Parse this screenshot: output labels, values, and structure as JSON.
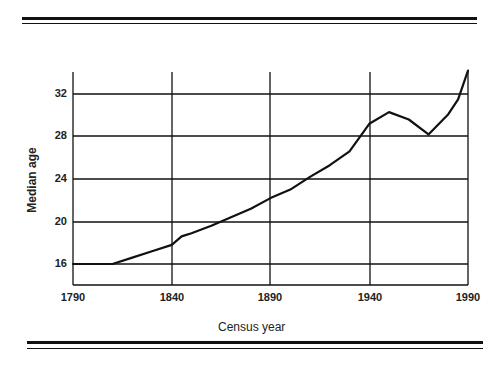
{
  "chart_data": {
    "type": "line",
    "title": "",
    "xlabel": "Census year",
    "ylabel": "Median age",
    "x_ticks": [
      "1790",
      "1840",
      "1890",
      "1940",
      "1990"
    ],
    "y_ticks": [
      "16",
      "20",
      "24",
      "28",
      "32"
    ],
    "xlim": [
      1790,
      1990
    ],
    "ylim": [
      14,
      34.5
    ],
    "grid": true,
    "legend": null,
    "series": [
      {
        "name": "Median age",
        "x": [
          1790,
          1800,
          1810,
          1820,
          1830,
          1840,
          1845,
          1850,
          1860,
          1870,
          1880,
          1890,
          1900,
          1910,
          1920,
          1930,
          1940,
          1950,
          1960,
          1970,
          1980,
          1985,
          1990
        ],
        "values": [
          16.0,
          16.0,
          16.0,
          16.6,
          17.2,
          17.8,
          18.6,
          18.9,
          19.6,
          20.4,
          21.2,
          22.2,
          23.0,
          24.2,
          25.3,
          26.6,
          29.2,
          30.3,
          29.6,
          28.2,
          30.1,
          31.5,
          34.2
        ]
      }
    ]
  },
  "axis": {
    "x_label": "Census year",
    "y_label": "Median age",
    "x_ticks": [
      {
        "label": "1790",
        "x": 73
      },
      {
        "label": "1840",
        "x": 172
      },
      {
        "label": "1890",
        "x": 270
      },
      {
        "label": "1940",
        "x": 370
      },
      {
        "label": "1990",
        "x": 468
      }
    ],
    "y_ticks": [
      {
        "label": "16",
        "y": 264
      },
      {
        "label": "20",
        "y": 222
      },
      {
        "label": "24",
        "y": 179
      },
      {
        "label": "28",
        "y": 136
      },
      {
        "label": "32",
        "y": 94
      }
    ]
  },
  "colors": {
    "ink": "#111111",
    "background": "#ffffff"
  }
}
